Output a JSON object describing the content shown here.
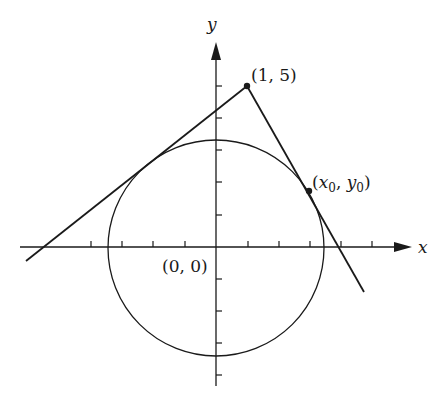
{
  "diagram": {
    "axes": {
      "x_label": "x",
      "y_label": "y",
      "origin_label": "(0, 0)",
      "unit_px": 31.5,
      "origin_px": [
        216,
        247
      ]
    },
    "circle": {
      "center": "(0, 0)",
      "radius_px": 108
    },
    "points": [
      {
        "name": "external-point",
        "label": "(1, 5)",
        "px": [
          247,
          86
        ]
      },
      {
        "name": "tangent-point",
        "label_base_x": "x",
        "label_sub_x": "0",
        "label_base_y": "y",
        "label_sub_y": "0",
        "px": [
          309,
          191
        ]
      }
    ],
    "lines": [
      {
        "name": "left-tangent-line",
        "from_px": [
          26,
          261
        ],
        "to_px": [
          247,
          86
        ]
      },
      {
        "name": "right-tangent-line",
        "from_px": [
          247,
          86
        ],
        "to_px": [
          364,
          292
        ]
      }
    ],
    "colors": {
      "ink": "#1a1a1a",
      "background": "#ffffff"
    }
  }
}
